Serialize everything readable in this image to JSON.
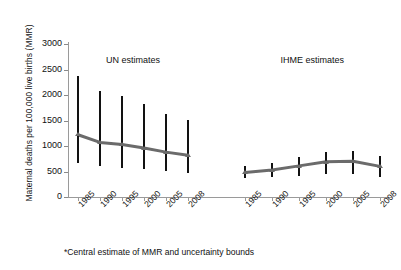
{
  "chart_data": {
    "type": "line",
    "title": "",
    "xlabel": "",
    "ylabel": "Maternal deaths per 100,000 live births (MMR)",
    "ylim": [
      0,
      3000
    ],
    "yticks": [
      0,
      500,
      1000,
      1500,
      2000,
      2500,
      3000
    ],
    "ytick_labels": [
      "0",
      "500",
      "1000",
      "1500",
      "2000",
      "2500",
      "3000"
    ],
    "grid": false,
    "legend_position": "none",
    "panels": [
      {
        "name": "UN estimates",
        "label": "UN estimates",
        "categories": [
          "1985",
          "1990",
          "1995",
          "2000",
          "2005",
          "2008"
        ],
        "values": [
          1220,
          1070,
          1030,
          960,
          880,
          820
        ],
        "lower": [
          670,
          600,
          575,
          545,
          515,
          470
        ],
        "upper": [
          2380,
          2080,
          1990,
          1820,
          1620,
          1510
        ]
      },
      {
        "name": "IHME estimates",
        "label": "IHME estimates",
        "categories": [
          "1985",
          "1990",
          "1995",
          "2000",
          "2005",
          "2008"
        ],
        "values": [
          480,
          530,
          610,
          690,
          700,
          600
        ],
        "lower": [
          370,
          400,
          420,
          450,
          460,
          400
        ],
        "upper": [
          610,
          660,
          790,
          890,
          900,
          800
        ]
      }
    ],
    "annotations": [
      "*Central estimate of MMR and uncertainty bounds"
    ]
  },
  "footnote": "*Central estimate of MMR and uncertainty bounds",
  "colors": {
    "bar": "#121212",
    "trend_line": "#6b6b6b",
    "axis": "#9a9a9a",
    "text": "#111111",
    "background": "#ffffff"
  }
}
